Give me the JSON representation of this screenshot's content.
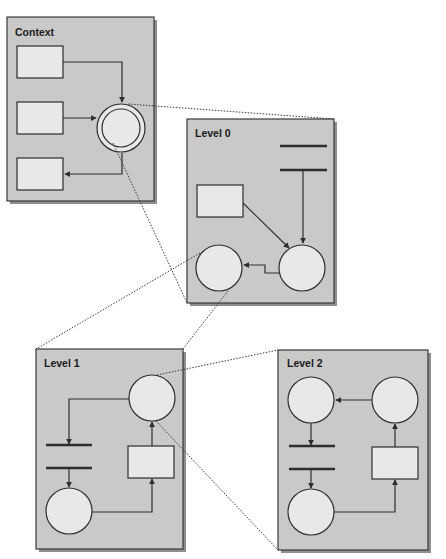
{
  "diagram": {
    "type": "hierarchical-decomposition",
    "panels": [
      {
        "id": "context",
        "label": "Context",
        "nodes": [
          "rect",
          "rect",
          "rect",
          "double-circle"
        ],
        "edges": [
          [
            "rect1",
            "double-circle"
          ],
          [
            "rect2",
            "double-circle"
          ],
          [
            "double-circle",
            "rect3"
          ]
        ]
      },
      {
        "id": "level0",
        "label": "Level 0",
        "nodes": [
          "bar",
          "bar",
          "rect",
          "circle",
          "circle"
        ],
        "edges": [
          [
            "bar2",
            "circle-right"
          ],
          [
            "rect",
            "circle-right"
          ],
          [
            "circle-right",
            "circle-left"
          ]
        ]
      },
      {
        "id": "level1",
        "label": "Level 1",
        "nodes": [
          "circle",
          "bar",
          "bar",
          "circle",
          "rect"
        ],
        "edges": [
          [
            "circle-top",
            "bar1"
          ],
          [
            "bar2",
            "circle-bottom"
          ],
          [
            "circle-bottom",
            "rect"
          ],
          [
            "rect",
            "circle-top"
          ]
        ]
      },
      {
        "id": "level2",
        "label": "Level 2",
        "nodes": [
          "circle",
          "circle",
          "bar",
          "bar",
          "circle",
          "rect"
        ],
        "edges": [
          [
            "circle-top-right",
            "circle-top-left"
          ],
          [
            "circle-top-left",
            "bar1"
          ],
          [
            "bar2",
            "circle-bottom"
          ],
          [
            "circle-bottom",
            "rect"
          ],
          [
            "rect",
            "circle-top-right"
          ]
        ]
      }
    ],
    "zoom_links": [
      {
        "from": "context.double-circle",
        "to": "level0"
      },
      {
        "from": "level0.circle-left",
        "to": "level1"
      },
      {
        "from": "level1.circle-top",
        "to": "level2"
      }
    ],
    "colors": {
      "panel": "#c9c9c9",
      "node": "#e8e8e8",
      "stroke": "#2e2e2e"
    }
  }
}
